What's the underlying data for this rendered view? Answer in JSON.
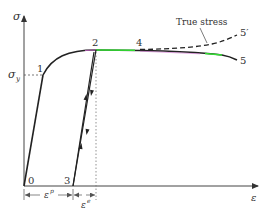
{
  "diagram": {
    "axes": {
      "y_label": "σ",
      "x_label": "ε",
      "yield_label": "σ",
      "yield_subscript": "y"
    },
    "points": {
      "p0": "0",
      "p1": "1",
      "p2": "2",
      "p3": "3",
      "p4": "4",
      "p5": "5",
      "p5prime": "5′"
    },
    "annotations": {
      "true_stress": "True stress"
    },
    "dimensions": {
      "plastic_strain": "ε",
      "plastic_sup": "p",
      "elastic_strain": "ε",
      "elastic_sup": "e"
    },
    "colors": {
      "curve": "#222222",
      "highlight_green": "#33dd33",
      "highlight_magenta": "#cc66cc",
      "axis": "#444444",
      "text": "#333333"
    }
  }
}
